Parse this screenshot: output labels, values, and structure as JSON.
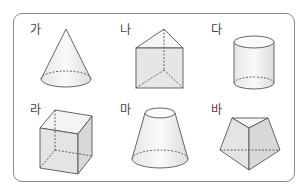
{
  "figure": {
    "items": [
      {
        "label": "가",
        "shape": "cone-icon"
      },
      {
        "label": "나",
        "shape": "triangular-prism-icon"
      },
      {
        "label": "다",
        "shape": "cylinder-icon"
      },
      {
        "label": "라",
        "shape": "cube-icon"
      },
      {
        "label": "마",
        "shape": "frustum-icon"
      },
      {
        "label": "바",
        "shape": "pentagonal-pyramid-icon"
      }
    ]
  }
}
